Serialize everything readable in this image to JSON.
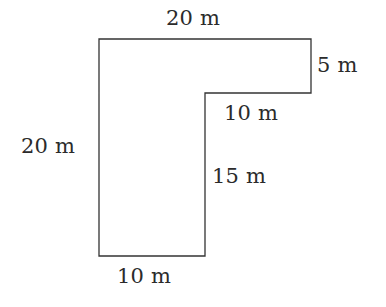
{
  "figure": {
    "kind": "composite-rectilinear-polygon",
    "unit": "m",
    "stroke_color": "#333333",
    "fill_color": "#ffffff",
    "background_color": "#ffffff",
    "stroke_width": 1.3,
    "outline_points": "99,39 311,39 311,93 205,93 205,256 99,256",
    "labels": {
      "top": "20 m",
      "right": "5 m",
      "notch": "10 m",
      "left": "20 m",
      "inner_vertical": "15 m",
      "bottom": "10 m"
    }
  }
}
